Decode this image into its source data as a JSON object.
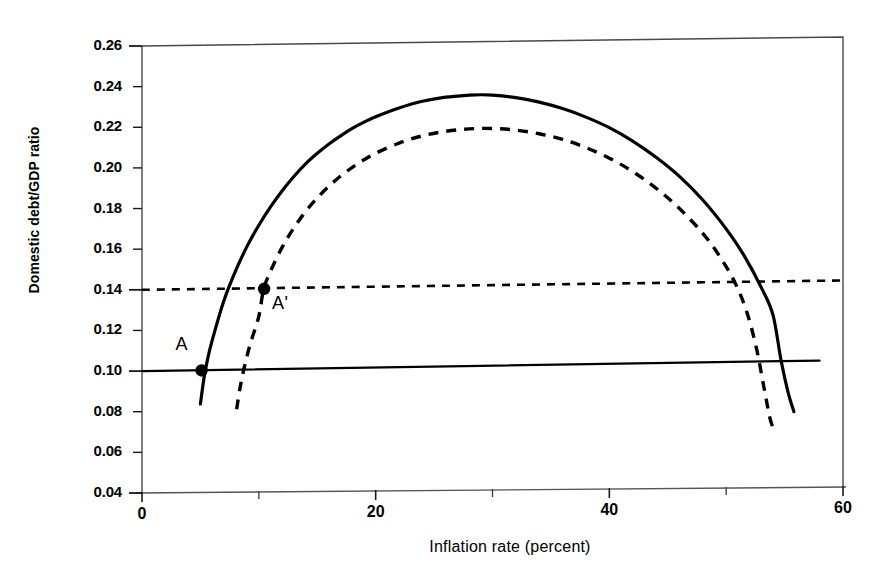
{
  "chart_data": {
    "type": "line",
    "title": "",
    "xlabel": "Inflation rate (percent)",
    "ylabel": "Domestic debt/GDP ratio",
    "xlim": [
      0,
      60
    ],
    "ylim": [
      0.04,
      0.26
    ],
    "grid": false,
    "legend": "none",
    "x_ticks_major": [
      "0",
      "20",
      "40",
      "60"
    ],
    "x_ticks_major_values": [
      0,
      20,
      40,
      60
    ],
    "x_ticks_minor_values": [
      10,
      30,
      50
    ],
    "y_ticks": [
      "0.26",
      "0.24",
      "0.22",
      "0.20",
      "0.18",
      "0.16",
      "0.14",
      "0.12",
      "0.10",
      "0.08",
      "0.06",
      "0.04"
    ],
    "y_tick_values": [
      0.26,
      0.24,
      0.22,
      0.2,
      0.18,
      0.16,
      0.14,
      0.12,
      0.1,
      0.08,
      0.06,
      0.04
    ],
    "series": [
      {
        "name": "seigniorage-laffer-curve-solid",
        "style": "solid",
        "points": [
          [
            5.0,
            0.0838
          ],
          [
            5.3,
            0.0963
          ],
          [
            5.6,
            0.1055
          ],
          [
            6.0,
            0.115
          ],
          [
            7.0,
            0.1345
          ],
          [
            8.0,
            0.1492
          ],
          [
            9.0,
            0.1615
          ],
          [
            10.0,
            0.1718
          ],
          [
            11.0,
            0.1808
          ],
          [
            12.0,
            0.1888
          ],
          [
            13.0,
            0.1958
          ],
          [
            14.0,
            0.202
          ],
          [
            15.0,
            0.2072
          ],
          [
            16.0,
            0.2118
          ],
          [
            17.0,
            0.2158
          ],
          [
            18.0,
            0.2194
          ],
          [
            19.0,
            0.2225
          ],
          [
            20.0,
            0.2252
          ],
          [
            22.0,
            0.2295
          ],
          [
            24.0,
            0.2328
          ],
          [
            26.0,
            0.2348
          ],
          [
            28.0,
            0.2358
          ],
          [
            29.0,
            0.236
          ],
          [
            30.0,
            0.2358
          ],
          [
            32.0,
            0.2346
          ],
          [
            34.0,
            0.2324
          ],
          [
            36.0,
            0.2292
          ],
          [
            38.0,
            0.225
          ],
          [
            40.0,
            0.2198
          ],
          [
            42.0,
            0.2132
          ],
          [
            44.0,
            0.2052
          ],
          [
            46.0,
            0.1958
          ],
          [
            48.0,
            0.1842
          ],
          [
            50.0,
            0.17
          ],
          [
            51.5,
            0.1572
          ],
          [
            53.0,
            0.1412
          ],
          [
            54.0,
            0.1278
          ],
          [
            54.7,
            0.1052
          ],
          [
            55.3,
            0.0895
          ],
          [
            55.8,
            0.08
          ]
        ]
      },
      {
        "name": "seigniorage-laffer-curve-dashed",
        "style": "dashed",
        "points": [
          [
            8.1,
            0.0812
          ],
          [
            8.4,
            0.092
          ],
          [
            8.8,
            0.103
          ],
          [
            9.3,
            0.114
          ],
          [
            10.0,
            0.127
          ],
          [
            10.4,
            0.14
          ],
          [
            11.0,
            0.1492
          ],
          [
            12.0,
            0.161
          ],
          [
            13.0,
            0.1705
          ],
          [
            14.0,
            0.1785
          ],
          [
            15.0,
            0.1852
          ],
          [
            16.0,
            0.191
          ],
          [
            17.0,
            0.196
          ],
          [
            18.0,
            0.2003
          ],
          [
            19.0,
            0.204
          ],
          [
            20.0,
            0.2072
          ],
          [
            22.0,
            0.2122
          ],
          [
            24.0,
            0.2158
          ],
          [
            26.0,
            0.218
          ],
          [
            28.0,
            0.2192
          ],
          [
            30.0,
            0.2194
          ],
          [
            32.0,
            0.2186
          ],
          [
            34.0,
            0.2168
          ],
          [
            36.0,
            0.214
          ],
          [
            38.0,
            0.21
          ],
          [
            40.0,
            0.2048
          ],
          [
            42.0,
            0.1982
          ],
          [
            44.0,
            0.19
          ],
          [
            46.0,
            0.18
          ],
          [
            48.0,
            0.1678
          ],
          [
            49.5,
            0.156
          ],
          [
            50.8,
            0.143
          ],
          [
            51.8,
            0.1285
          ],
          [
            52.6,
            0.111
          ],
          [
            53.2,
            0.093
          ],
          [
            53.7,
            0.078
          ],
          [
            54.0,
            0.0722
          ]
        ]
      },
      {
        "name": "debt-ratio-line-solid",
        "style": "solid-horizontal",
        "points": [
          [
            0.0,
            0.1
          ],
          [
            58.0,
            0.1052
          ]
        ]
      },
      {
        "name": "debt-ratio-line-dashed",
        "style": "dashed-horizontal",
        "points": [
          [
            0.0,
            0.14
          ],
          [
            60.0,
            0.1446
          ]
        ]
      }
    ],
    "annotations": [
      {
        "label": "A",
        "point_x": 5.1,
        "point_y": 0.1003,
        "text_dx": -26,
        "text_dy": -26
      },
      {
        "label": "A'",
        "point_x": 10.45,
        "point_y": 0.1405,
        "text_dx": 8,
        "text_dy": 14
      }
    ]
  }
}
